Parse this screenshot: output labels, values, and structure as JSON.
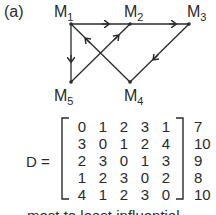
{
  "figure_label": "(a)",
  "graph": {
    "nodes": [
      {
        "id": "M1",
        "base": "M",
        "sub": "1"
      },
      {
        "id": "M2",
        "base": "M",
        "sub": "2"
      },
      {
        "id": "M3",
        "base": "M",
        "sub": "3"
      },
      {
        "id": "M4",
        "base": "M",
        "sub": "4"
      },
      {
        "id": "M5",
        "base": "M",
        "sub": "5"
      }
    ],
    "edges": [
      {
        "from": "M1",
        "to": "M2"
      },
      {
        "from": "M2",
        "to": "M3"
      },
      {
        "from": "M1",
        "to": "M5"
      },
      {
        "from": "M5",
        "to": "M2"
      },
      {
        "from": "M4",
        "to": "M1"
      },
      {
        "from": "M3",
        "to": "M4"
      }
    ]
  },
  "matrix": {
    "name": "D",
    "equals": "D =",
    "rows": [
      [
        "0",
        "1",
        "2",
        "3",
        "1"
      ],
      [
        "3",
        "0",
        "1",
        "2",
        "4"
      ],
      [
        "2",
        "3",
        "0",
        "1",
        "3"
      ],
      [
        "1",
        "2",
        "3",
        "0",
        "2"
      ],
      [
        "4",
        "1",
        "2",
        "3",
        "0"
      ]
    ],
    "row_sums": [
      "7",
      "10",
      "9",
      "8",
      "10"
    ]
  },
  "footer_text": "most to least influential"
}
